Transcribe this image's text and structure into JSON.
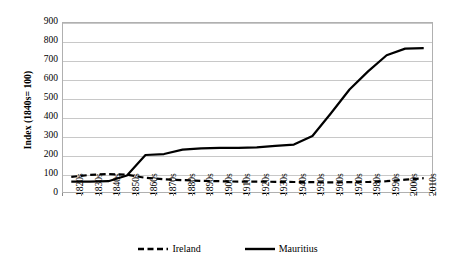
{
  "chart_data": {
    "type": "line",
    "title": "",
    "subtitle": "",
    "xlabel": "",
    "ylabel": "Index (1840s= 100)",
    "ylim": [
      0,
      900
    ],
    "ytick_step": 100,
    "yticks": [
      "0",
      "100",
      "200",
      "300",
      "400",
      "500",
      "600",
      "700",
      "800",
      "900"
    ],
    "grid": "horizontal",
    "legend_position": "bottom",
    "categories": [
      "1820s",
      "1830s",
      "1840s",
      "1850s",
      "1860s",
      "1870s",
      "1880s",
      "1890s",
      "1900s",
      "1910s",
      "1920s",
      "1930s",
      "1940s",
      "1950s",
      "1960s",
      "1970s",
      "1980s",
      "1990s",
      "2000s",
      "2010s"
    ],
    "series": [
      {
        "name": "Ireland",
        "style": "dashed",
        "color": "#000000",
        "values": [
          85,
          95,
          100,
          96,
          80,
          72,
          68,
          64,
          62,
          60,
          60,
          59,
          58,
          57,
          56,
          57,
          58,
          62,
          70,
          78
        ]
      },
      {
        "name": "Mauritius",
        "style": "solid",
        "color": "#000000",
        "values": [
          60,
          60,
          62,
          92,
          200,
          205,
          228,
          235,
          238,
          238,
          240,
          248,
          255,
          300,
          420,
          545,
          640,
          725,
          760,
          762
        ]
      }
    ]
  },
  "axis": {
    "y_title": "Index (1840s= 100)"
  },
  "legend": {
    "items": [
      {
        "label": "Ireland",
        "style": "dashed"
      },
      {
        "label": "Mauritius",
        "style": "solid"
      }
    ]
  }
}
